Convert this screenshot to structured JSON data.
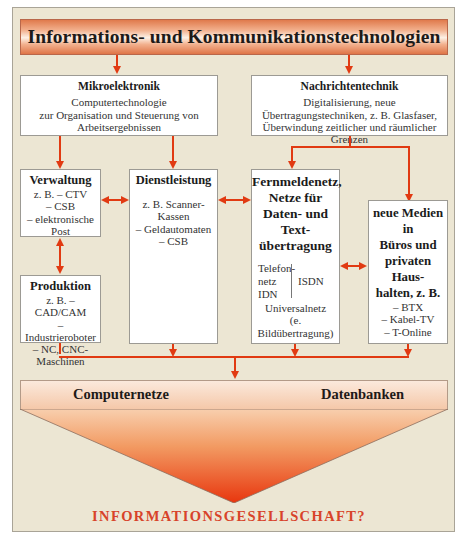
{
  "title": "Informations- und Kommunikationstechnologien",
  "mikroelektronik": {
    "title": "Mikroelektronik",
    "lines": [
      "Computertechnologie",
      "zur Organisation und Steuerung von",
      "Arbeitsergebnissen"
    ]
  },
  "nachrichtentechnik": {
    "title": "Nachrichtentechnik",
    "lines": [
      "Digitalisierung, neue",
      "Übertragungstechniken, z. B. Glasfaser,",
      "Überwindung zeitlicher und räumlicher Grenzen"
    ]
  },
  "verwaltung": {
    "title": "Verwaltung",
    "lines": [
      "z. B. – CTV",
      "– CSB",
      "– elektronische",
      "Post"
    ]
  },
  "produktion": {
    "title": "Produktion",
    "lines": [
      "z. B. –  CAD/CAM",
      "– Industrieroboter",
      "– NC, CNC-",
      "Maschinen"
    ]
  },
  "dienstleistung": {
    "title": "Dienstleistung",
    "lines": [
      "z. B. Scanner-",
      "Kassen",
      "– Geldautomaten",
      "– CSB"
    ]
  },
  "fernmeldenetz": {
    "title_lines": [
      "Fernmeldenetz,",
      "Netze für",
      "Daten- und Text-",
      "übertragung"
    ],
    "left_lines": [
      "Telefon-",
      "netz",
      "IDN"
    ],
    "right_label": "ISDN",
    "bottom_lines": [
      "Universalnetz",
      "(e. Bildübertragung)"
    ]
  },
  "neue_medien": {
    "title_lines": [
      "neue Medien in",
      "Büros und",
      "privaten Haus-",
      "halten, z. B."
    ],
    "lines": [
      "– BTX",
      "– Kabel-TV",
      "– T-Online"
    ]
  },
  "bottom_bar": {
    "left": "Computernetze",
    "right": "Datenbanken"
  },
  "footer": "INFORMATIONSGESELLSCHAFT?",
  "colors": {
    "arrow": "#e13a12",
    "background": "#ece6d3",
    "banner": "#e07a4c",
    "footer_text": "#d8432a"
  }
}
